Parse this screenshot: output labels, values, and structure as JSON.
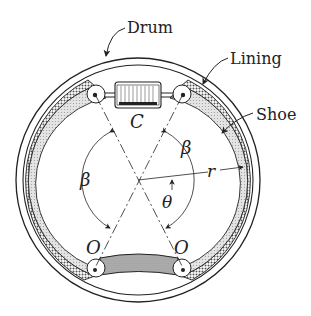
{
  "diagram": {
    "type": "drum-brake-cross-section",
    "labels": {
      "drum": "Drum",
      "lining": "Lining",
      "shoe": "Shoe",
      "cylinder": "C",
      "pivot_left": "O",
      "pivot_right": "O",
      "angle_beta_left": "β",
      "angle_beta_right": "β",
      "angle_theta": "θ",
      "radius": "r"
    },
    "colors": {
      "line": "#222222",
      "shoe_fill": "#d9d9d9",
      "lining_fill": "#9a9a9a",
      "background": "#ffffff"
    }
  }
}
